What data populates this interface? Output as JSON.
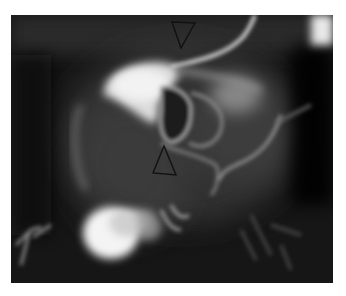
{
  "figure": {
    "type": "radiograph",
    "description": "Grayscale contrast X-ray (angiographic/fluoroscopic) image with two black outlined triangular arrowheads",
    "background_color": "#141414",
    "annotations": [
      {
        "shape": "arrowhead-triangle",
        "direction": "down",
        "position": "top-center"
      },
      {
        "shape": "arrowhead-triangle",
        "direction": "up",
        "position": "center"
      }
    ]
  }
}
